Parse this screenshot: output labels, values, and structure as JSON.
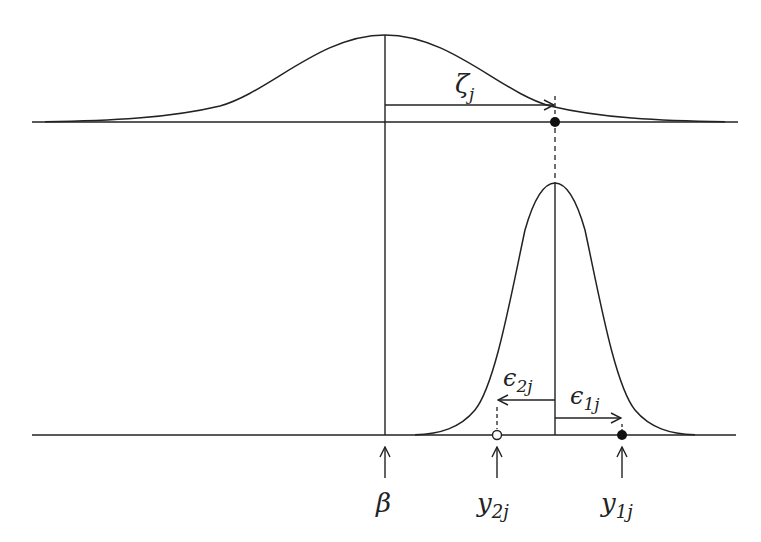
{
  "diagram": {
    "title": "",
    "colors": {
      "stroke": "#222222",
      "background": "#ffffff"
    },
    "top_distribution": {
      "description": "wide normal density centered at beta",
      "center_label": "β"
    },
    "bottom_distribution": {
      "description": "narrow normal density centered at beta + zeta_j"
    },
    "labels": {
      "zeta": {
        "main": "ζ",
        "sub": "j"
      },
      "eps2": {
        "main": "ϵ",
        "sub": "2j"
      },
      "eps1": {
        "main": "ϵ",
        "sub": "1j"
      },
      "beta": {
        "main": "β",
        "sub": ""
      },
      "y2": {
        "main": "y",
        "sub": "2j"
      },
      "y1": {
        "main": "y",
        "sub": "1j"
      }
    },
    "points": [
      {
        "name": "beta-plus-zeta",
        "marker": "filled",
        "axis": "top"
      },
      {
        "name": "y2j",
        "marker": "open",
        "axis": "bottom"
      },
      {
        "name": "y1j",
        "marker": "filled",
        "axis": "bottom"
      }
    ]
  }
}
